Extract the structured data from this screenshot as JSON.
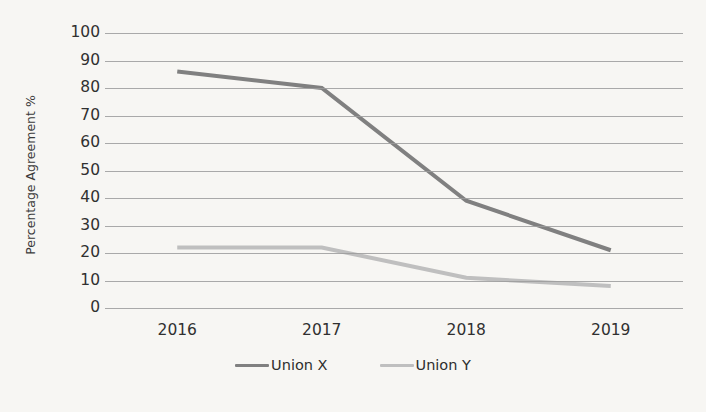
{
  "chart_data": {
    "type": "line",
    "title": "",
    "subtitle": "",
    "xlabel": "",
    "ylabel": "Percentage Agreement %",
    "categories": [
      "2016",
      "2017",
      "2018",
      "2019"
    ],
    "series": [
      {
        "name": "Union X",
        "values": [
          86,
          80,
          39,
          21
        ],
        "color": "#808080"
      },
      {
        "name": "Union Y",
        "values": [
          22,
          22,
          11,
          8
        ],
        "color": "#bfbfbf"
      }
    ],
    "ylim": [
      0,
      100
    ],
    "y_ticks": [
      100,
      90,
      80,
      70,
      60,
      50,
      40,
      30,
      20,
      10,
      0
    ],
    "grid": "horizontal",
    "legend_position": "bottom",
    "markers": false,
    "annotations": []
  },
  "axes": {
    "y_title": "Percentage Agreement %",
    "y_tick_labels": [
      "100",
      "90",
      "80",
      "70",
      "60",
      "50",
      "40",
      "30",
      "20",
      "10",
      "0"
    ],
    "x_tick_labels": [
      "2016",
      "2017",
      "2018",
      "2019"
    ]
  },
  "legend": {
    "items": [
      {
        "label": "Union X",
        "color": "#808080"
      },
      {
        "label": "Union Y",
        "color": "#bfbfbf"
      }
    ]
  },
  "page": {
    "background": "#f7f6f3",
    "gridline_color": "#9b9b9b",
    "text_color": "#303030"
  }
}
